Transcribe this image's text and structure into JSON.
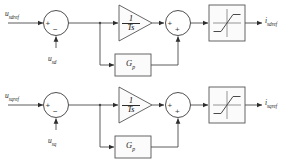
{
  "diagram": {
    "type": "control-block-diagram",
    "channels": [
      {
        "id": "d-axis",
        "input_label": "u",
        "input_sub": "sdref",
        "feedback_label": "u",
        "feedback_sub": "sd",
        "output_label": "i",
        "output_sub": "sdref",
        "error_sum": {
          "sign_in": "+",
          "sign_fb": "−"
        },
        "integral_block": {
          "numerator": "1",
          "denominator": "Ts"
        },
        "proportional_block": {
          "label": "G",
          "sub": "p"
        },
        "output_sum": {
          "sign_a": "+",
          "sign_b": "+"
        },
        "limiter": "saturation"
      },
      {
        "id": "q-axis",
        "input_label": "u",
        "input_sub": "sqref",
        "feedback_label": "u",
        "feedback_sub": "sq",
        "output_label": "i",
        "output_sub": "sqref",
        "error_sum": {
          "sign_in": "+",
          "sign_fb": "−"
        },
        "integral_block": {
          "numerator": "1",
          "denominator": "Ts"
        },
        "proportional_block": {
          "label": "G",
          "sub": "p"
        },
        "output_sum": {
          "sign_a": "+",
          "sign_b": "+"
        },
        "limiter": "saturation"
      }
    ],
    "colors": {
      "wire": "#4a4a4a",
      "block_stroke": "#555555",
      "block_fill": "#fbfbfb",
      "text": "#1c1c1c",
      "background": "#ffffff"
    }
  }
}
